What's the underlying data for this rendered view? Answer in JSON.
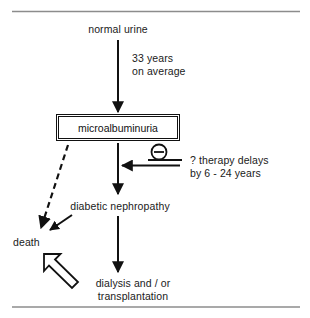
{
  "figure": {
    "nodes": {
      "normal_urine": "normal urine",
      "microalbuminuria": "microalbuminuria",
      "diabetic_nephropathy": "diabetic nephropathy",
      "death": "death",
      "dialysis_transplantation": "dialysis and / or\ntransplantation"
    },
    "annotations": {
      "progression_time_line1": "33 years",
      "progression_time_line2": "on average",
      "therapy_line1": "? therapy delays",
      "therapy_line2": "by 6 - 24 years",
      "inhibition_symbol": "⊖"
    },
    "colors": {
      "ink": "#111111",
      "rule": "#8c8c8c",
      "background": "#ffffff"
    }
  }
}
